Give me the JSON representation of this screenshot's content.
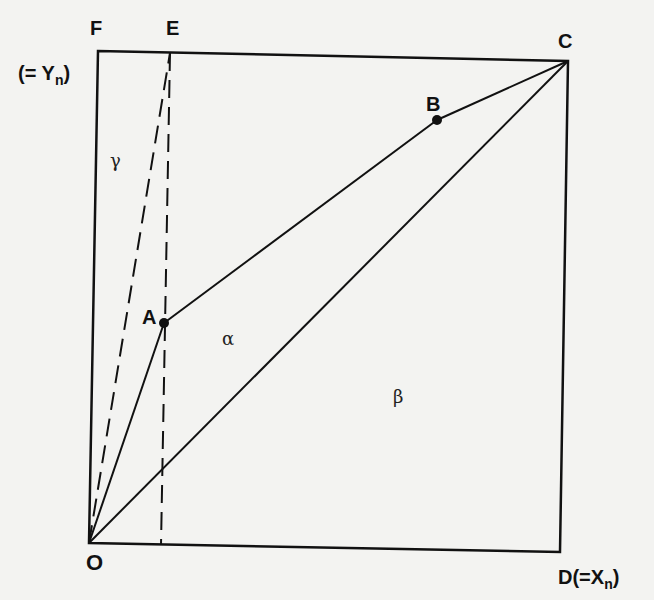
{
  "diagram": {
    "type": "geometric-box-diagram",
    "points": {
      "F": {
        "label": "F"
      },
      "E": {
        "label": "E"
      },
      "C": {
        "label": "C"
      },
      "B": {
        "label": "B"
      },
      "A": {
        "label": "A"
      },
      "O": {
        "label": "O"
      },
      "D": {
        "label": "D(=X",
        "sub": "n",
        "close": ")"
      }
    },
    "y_axis_label": {
      "prefix": "(= Y",
      "sub": "n",
      "close": ")"
    },
    "regions": {
      "alpha": "α",
      "beta": "β",
      "gamma": "γ"
    },
    "lines": [
      {
        "from": "O",
        "to": "A",
        "style": "solid"
      },
      {
        "from": "A",
        "to": "B",
        "style": "solid"
      },
      {
        "from": "B",
        "to": "C",
        "style": "solid"
      },
      {
        "from": "O",
        "to": "C",
        "style": "solid"
      },
      {
        "from": "O",
        "to": "E",
        "style": "dashed"
      },
      {
        "from": "E",
        "to": "x-axis",
        "style": "dashed",
        "note": "vertical through A"
      }
    ],
    "colors": {
      "ink": "#111111",
      "paper": "#f3f3f1"
    }
  }
}
